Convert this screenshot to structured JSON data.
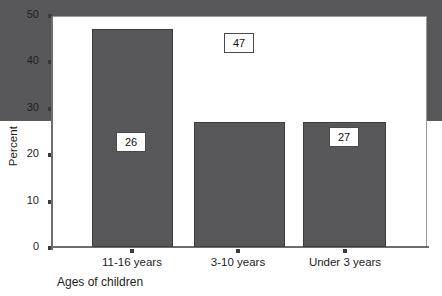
{
  "chart_data": {
    "type": "bar",
    "title": "",
    "xlabel": "Ages of children",
    "ylabel": "Percent",
    "categories": [
      "11-16 years",
      "3-10 years",
      "Under 3 years"
    ],
    "values": [
      26,
      47,
      27
    ],
    "value_labels": [
      "26",
      "47",
      "27"
    ],
    "ylim": [
      0,
      50
    ],
    "yticks": [
      0,
      10,
      20,
      30,
      40,
      50
    ],
    "ytick_labels": [
      "0",
      "10",
      "20",
      "30",
      "40",
      "50"
    ],
    "grid": false,
    "legend": false,
    "series": [
      {
        "name": "Percent",
        "values": [
          26,
          47,
          27
        ]
      }
    ],
    "colors": {
      "bar_fill": "#58585a",
      "bar_border": "#3e3e40",
      "axis": "#6d6d6d",
      "text": "#1d1d1d",
      "label_box_fill": "#ffffff",
      "label_box_border": "#4a4a4a",
      "background": "#ffffff"
    }
  }
}
